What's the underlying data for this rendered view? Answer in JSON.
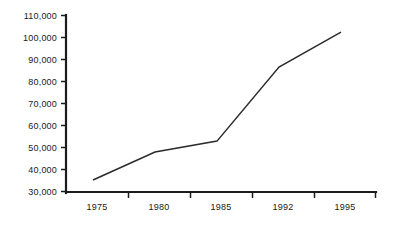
{
  "chart_data": {
    "type": "line",
    "title": "",
    "subtitle": "",
    "xlabel": "",
    "ylabel": "",
    "categories": [
      "1975",
      "1980",
      "1985",
      "1992",
      "1995"
    ],
    "values": [
      35400,
      48100,
      53000,
      86500,
      102300
    ],
    "series": [
      {
        "name": "",
        "values": [
          35400,
          48100,
          53000,
          86500,
          102300
        ]
      }
    ],
    "ylim": [
      30000,
      110000
    ],
    "ytick_values": [
      30000,
      40000,
      50000,
      60000,
      70000,
      80000,
      90000,
      100000,
      110000
    ],
    "ytick_labels": [
      "30,000",
      "40,000",
      "50,000",
      "60,000",
      "70,000",
      "80,000",
      "90,000",
      "100,000",
      "110,000"
    ],
    "xtick_labels": [
      "1975",
      "1980",
      "1985",
      "1992",
      "1995"
    ],
    "grid": false,
    "legend": false,
    "legend_position": "none",
    "annotations": [],
    "line_color": "#2b2b2b",
    "axis_color": "#1c1c1c",
    "background_color": "#ffffff",
    "markers": false
  },
  "axis": {
    "y_labels": [
      "110,000",
      "100,000",
      "90,000",
      "80,000",
      "70,000",
      "60,000",
      "50,000",
      "40,000",
      "30,000"
    ],
    "x_labels": [
      "1975",
      "1980",
      "1985",
      "1992",
      "1995"
    ]
  }
}
